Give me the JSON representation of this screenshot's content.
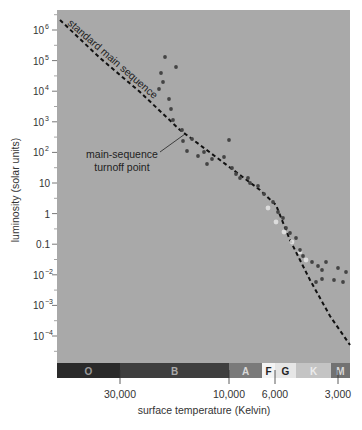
{
  "chart_data": {
    "type": "scatter",
    "title": "",
    "xlabel": "surface temperature (Kelvin)",
    "ylabel": "luminosity (solar units)",
    "x_scale": "log-reversed",
    "y_scale": "log",
    "ylim": [
      1e-05,
      2000000
    ],
    "xlim": [
      45000,
      2700
    ],
    "grid": false,
    "legend": "none",
    "y_ticks": [
      {
        "value": 1000000,
        "label": "10",
        "sup": "6"
      },
      {
        "value": 100000,
        "label": "10",
        "sup": "5"
      },
      {
        "value": 10000,
        "label": "10",
        "sup": "4"
      },
      {
        "value": 1000,
        "label": "10",
        "sup": "3"
      },
      {
        "value": 100,
        "label": "10",
        "sup": "2"
      },
      {
        "value": 10,
        "label": "10",
        "sup": ""
      },
      {
        "value": 1,
        "label": "1",
        "sup": ""
      },
      {
        "value": 0.1,
        "label": "0.1",
        "sup": ""
      },
      {
        "value": 0.01,
        "label": "10",
        "sup": "−2"
      },
      {
        "value": 0.001,
        "label": "10",
        "sup": "−3"
      },
      {
        "value": 0.0001,
        "label": "10",
        "sup": "−4"
      }
    ],
    "x_ticks": [
      {
        "value": 30000,
        "label": "30,000"
      },
      {
        "value": 10000,
        "label": "10,000"
      },
      {
        "value": 6000,
        "label": "6,000"
      },
      {
        "value": 3000,
        "label": "3,000"
      }
    ],
    "spectral_classes": [
      {
        "label": "O",
        "x0": 57,
        "x1": 120,
        "color": "#2a2a2a",
        "text": "#9a9a9a"
      },
      {
        "label": "B",
        "x0": 120,
        "x1": 229,
        "color": "#3e3e3e",
        "text": "#aaaaaa"
      },
      {
        "label": "A",
        "x0": 229,
        "x1": 262,
        "color": "#7a7a7a",
        "text": "#d8d8d8"
      },
      {
        "label": "F",
        "x0": 262,
        "x1": 275,
        "color": "#f4f4f4",
        "text": "#222222"
      },
      {
        "label": "G",
        "x0": 275,
        "x1": 296,
        "color": "#e6e6e6",
        "text": "#222222"
      },
      {
        "label": "K",
        "x0": 296,
        "x1": 331,
        "color": "#c4c4c4",
        "text": "#ececec"
      },
      {
        "label": "M",
        "x0": 331,
        "x1": 350,
        "color": "#727272",
        "text": "#d8d8d8"
      }
    ],
    "series": [
      {
        "name": "standard main sequence",
        "kind": "dashed-line",
        "points_px": [
          [
            60,
            20
          ],
          [
            100,
            58
          ],
          [
            140,
            92
          ],
          [
            180,
            130
          ],
          [
            220,
            160
          ],
          [
            260,
            190
          ],
          [
            276,
            205
          ],
          [
            290,
            240
          ],
          [
            310,
            280
          ],
          [
            330,
            316
          ],
          [
            350,
            345
          ]
        ]
      },
      {
        "name": "cluster stars",
        "kind": "scatter",
        "points_px": [
          [
            165,
            57
          ],
          [
            176,
            67
          ],
          [
            161,
            73
          ],
          [
            163,
            82
          ],
          [
            159,
            89
          ],
          [
            169,
            99
          ],
          [
            171,
            109
          ],
          [
            173,
            120
          ],
          [
            182,
            130
          ],
          [
            183,
            141
          ],
          [
            192,
            139
          ],
          [
            187,
            151
          ],
          [
            198,
            156
          ],
          [
            204,
            152
          ],
          [
            207,
            164
          ],
          [
            212,
            159
          ],
          [
            224,
            157
          ],
          [
            229,
            140
          ],
          [
            232,
            168
          ],
          [
            236,
            174
          ],
          [
            240,
            178
          ],
          [
            248,
            178
          ],
          [
            250,
            183
          ],
          [
            258,
            186
          ],
          [
            264,
            194
          ],
          [
            273,
            202
          ],
          [
            278,
            212
          ],
          [
            283,
            218
          ],
          [
            286,
            228
          ],
          [
            290,
            233
          ],
          [
            296,
            238
          ],
          [
            300,
            250
          ],
          [
            303,
            256
          ],
          [
            312,
            262
          ],
          [
            318,
            266
          ],
          [
            326,
            262
          ],
          [
            322,
            270
          ],
          [
            338,
            268
          ],
          [
            346,
            272
          ],
          [
            334,
            280
          ],
          [
            343,
            282
          ],
          [
            322,
            279
          ],
          [
            316,
            282
          ]
        ],
        "light_points_px": [
          [
            268,
            208
          ],
          [
            276,
            222
          ],
          [
            284,
            232
          ],
          [
            292,
            242
          ],
          [
            300,
            252
          ],
          [
            306,
            260
          ]
        ]
      }
    ],
    "annotations": [
      {
        "text": "standard main sequence",
        "x": 66,
        "y": 26,
        "rotate": 41
      },
      {
        "text_lines": [
          "main-sequence",
          "turnoff point"
        ],
        "x": 122,
        "y": 158,
        "arrow_from": [
          160,
          152
        ],
        "arrow_to": [
          185,
          134
        ]
      }
    ]
  },
  "labels": {
    "ylabel": "luminosity (solar units)",
    "xlabel": "surface temperature (Kelvin)",
    "mainseq": "standard main sequence",
    "turnoff_line1": "main-sequence",
    "turnoff_line2": "turnoff point"
  },
  "colors": {
    "plot_bg": "#a9a9a9",
    "dot": "#444444",
    "dot_light": "#e8e8e8",
    "line": "#111111",
    "axis_text": "#333333"
  }
}
